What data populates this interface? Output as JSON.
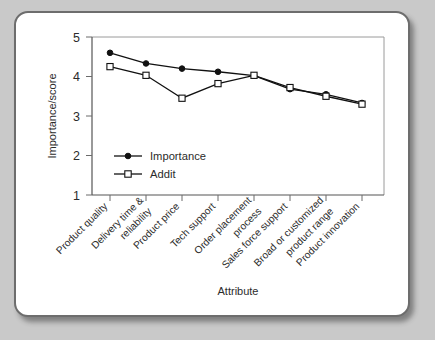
{
  "figure": {
    "background_color": "#c9c9c9",
    "card_color": "#ffffff",
    "border_color": "#6d6d6d"
  },
  "chart_data": {
    "type": "line",
    "title": "",
    "xlabel": "Attribute",
    "ylabel": "Importance/score",
    "ylim": [
      1,
      5
    ],
    "yticks": [
      1,
      2,
      3,
      4,
      5
    ],
    "ytick_labels": [
      "1",
      "2",
      "3",
      "4",
      "5"
    ],
    "grid": false,
    "legend_position": "inside-left-lower",
    "categories": [
      "Product quality",
      "Delivery time & reliability",
      "Product price",
      "Tech support",
      "Order placement process",
      "Sales force support",
      "Broad or customized product range",
      "Product innovation"
    ],
    "series": [
      {
        "name": "Importance",
        "marker": "filled-circle",
        "values": [
          4.6,
          4.33,
          4.2,
          4.12,
          4.02,
          3.68,
          3.55,
          3.33
        ]
      },
      {
        "name": "Addit",
        "marker": "open-square",
        "values": [
          4.25,
          4.03,
          3.45,
          3.82,
          4.03,
          3.72,
          3.5,
          3.3
        ]
      }
    ]
  },
  "legend": {
    "items": [
      {
        "label": "Importance",
        "marker": "filled-circle"
      },
      {
        "label": "Addit",
        "marker": "open-square"
      }
    ]
  }
}
